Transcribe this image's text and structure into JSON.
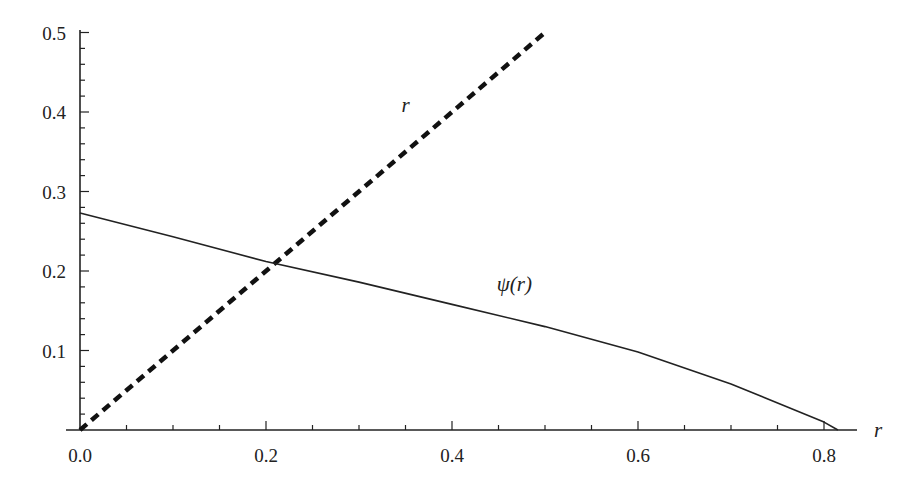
{
  "chart_data": {
    "type": "line",
    "title": "",
    "xlabel": "r",
    "ylabel": "",
    "xlim": [
      0,
      0.84
    ],
    "ylim": [
      0,
      0.5
    ],
    "grid": false,
    "legend": null,
    "x_ticks": [
      "0.0",
      "0.2",
      "0.4",
      "0.6",
      "0.8"
    ],
    "y_ticks": [
      "0.1",
      "0.2",
      "0.3",
      "0.4",
      "0.5"
    ],
    "series": [
      {
        "name": "r",
        "style": "dashed-thick",
        "label": "r",
        "x": [
          0.0,
          0.5
        ],
        "y": [
          0.0,
          0.5
        ]
      },
      {
        "name": "ψ(r)",
        "style": "solid-thin",
        "label": "ψ(r)",
        "x": [
          0.0,
          0.1,
          0.2,
          0.3,
          0.4,
          0.5,
          0.6,
          0.7,
          0.8,
          0.815
        ],
        "y": [
          0.273,
          0.243,
          0.212,
          0.186,
          0.158,
          0.13,
          0.098,
          0.058,
          0.01,
          0.0
        ]
      }
    ],
    "annotations": [
      {
        "text": "r",
        "x": 0.35,
        "y": 0.4
      },
      {
        "text": "ψ(r)",
        "x": 0.467,
        "y": 0.175
      }
    ]
  },
  "axes": {
    "x_axis_label": "r",
    "x_tick_labels": [
      "0.0",
      "0.2",
      "0.4",
      "0.6",
      "0.8"
    ],
    "y_tick_labels": [
      "0.1",
      "0.2",
      "0.3",
      "0.4",
      "0.5"
    ]
  },
  "labels": {
    "dashed_line": "r",
    "solid_curve": "ψ(r)"
  }
}
